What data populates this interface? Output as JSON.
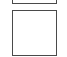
{
  "panels": [
    {
      "id": "top",
      "label": ""
    },
    {
      "id": "main",
      "label": ""
    }
  ],
  "colors": {
    "border": "#4a4a4a",
    "background": "#ffffff"
  }
}
